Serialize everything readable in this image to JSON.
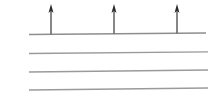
{
  "figure": {
    "title": "Upward arrows rising from the top of a set of stacked horizontal lines",
    "caption": "",
    "width": 219,
    "height": 101,
    "background_color": "#ffffff"
  },
  "chart_data": {
    "type": "diagram",
    "title": "",
    "xlabel": "",
    "ylabel": "",
    "grid": false,
    "legend": null,
    "axis_ranges": {
      "x": [
        0,
        219
      ],
      "y": [
        0,
        101
      ]
    },
    "horizontal_lines": [
      {
        "name": "line-1-top",
        "x1": 29,
        "y1": 34.5,
        "x2": 206,
        "y2": 33.0,
        "color": "#8d8d8d",
        "width": 1.4
      },
      {
        "name": "line-2",
        "x1": 29,
        "y1": 53.5,
        "x2": 208,
        "y2": 51.8,
        "color": "#9a9a9a",
        "width": 1.3
      },
      {
        "name": "line-3",
        "x1": 29,
        "y1": 72.0,
        "x2": 208,
        "y2": 70.0,
        "color": "#9a9a9a",
        "width": 1.3
      },
      {
        "name": "line-4-bottom",
        "x1": 29,
        "y1": 90.0,
        "x2": 208,
        "y2": 88.0,
        "color": "#9a9a9a",
        "width": 1.3
      }
    ],
    "arrows": [
      {
        "name": "arrow-1",
        "x": 51,
        "base_y": 34.3,
        "tip_y": 4.0,
        "direction": "up",
        "color": "#5f5f5f",
        "head_color": "#2a2a2a",
        "shaft_width": 1.5,
        "head_width": 5,
        "head_length": 9
      },
      {
        "name": "arrow-2",
        "x": 114,
        "base_y": 33.8,
        "tip_y": 4.0,
        "direction": "up",
        "color": "#5f5f5f",
        "head_color": "#2a2a2a",
        "shaft_width": 1.5,
        "head_width": 5,
        "head_length": 9
      },
      {
        "name": "arrow-3",
        "x": 177,
        "base_y": 33.3,
        "tip_y": 4.0,
        "direction": "up",
        "color": "#5f5f5f",
        "head_color": "#2a2a2a",
        "shaft_width": 1.5,
        "head_width": 5,
        "head_length": 9
      }
    ],
    "labels": []
  }
}
